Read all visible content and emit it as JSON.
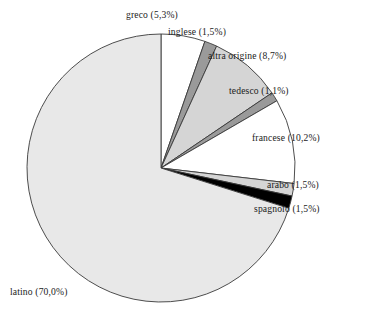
{
  "chart_data": {
    "type": "pie",
    "title": "",
    "subtitle": "",
    "xlabel": "",
    "ylabel": "",
    "legend_position": "none",
    "grid": false,
    "label_format": "name (value%) with comma decimal separator",
    "start_angle_deg": 0,
    "direction": "clockwise",
    "categories": [
      "greco",
      "inglese",
      "altra origine",
      "tedesco",
      "francese",
      "arabo",
      "spagnolo",
      "latino"
    ],
    "values": [
      5.3,
      1.5,
      8.7,
      1.1,
      10.2,
      1.5,
      1.5,
      70.0
    ],
    "slices": [
      {
        "name": "greco",
        "value": 5.3,
        "label": "greco (5,3%)",
        "color": "#ffffff"
      },
      {
        "name": "inglese",
        "value": 1.5,
        "label": "inglese (1,5%)",
        "color": "#9a9a9a"
      },
      {
        "name": "altra origine",
        "value": 8.7,
        "label": "altra origine (8,7%)",
        "color": "#d5d5d5"
      },
      {
        "name": "tedesco",
        "value": 1.1,
        "label": "tedesco (1,1%)",
        "color": "#9a9a9a"
      },
      {
        "name": "francese",
        "value": 10.2,
        "label": "francese (10,2%)",
        "color": "#ffffff"
      },
      {
        "name": "arabo",
        "value": 1.5,
        "label": "arabo (1,5%)",
        "color": "#d5d5d5"
      },
      {
        "name": "spagnolo",
        "value": 1.5,
        "label": "spagnolo (1,5%)",
        "color": "#000000"
      },
      {
        "name": "latino",
        "value": 70.0,
        "label": "latino (70,0%)",
        "color": "#e8e8e8"
      }
    ]
  },
  "geometry": {
    "center_x": 161,
    "center_y": 168,
    "radius": 134
  },
  "colors": {
    "outline": "#3a3a3a",
    "background": "#ffffff",
    "text": "#1b1b1b"
  }
}
